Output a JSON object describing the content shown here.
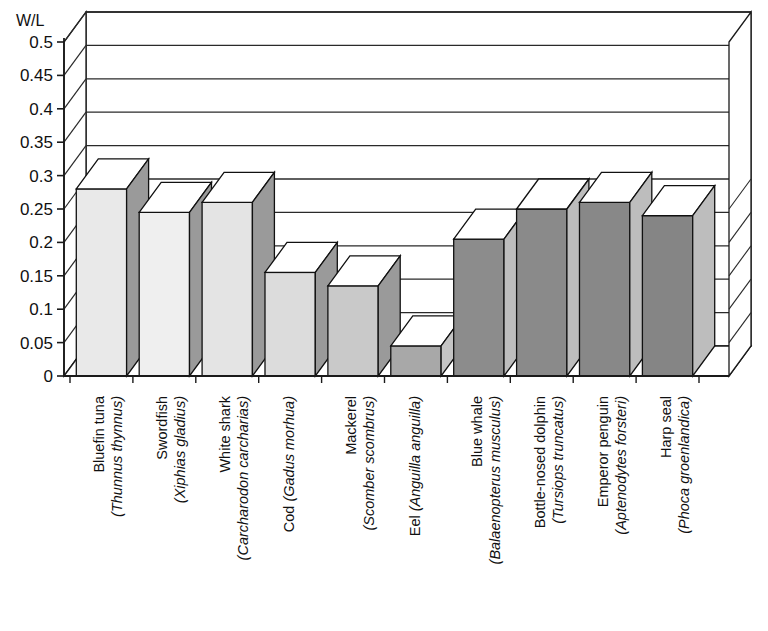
{
  "chart_data": {
    "type": "bar",
    "title": "",
    "xlabel": "",
    "ylabel": "W/L",
    "ylim": [
      0,
      0.5
    ],
    "grid": true,
    "legend": "none",
    "style": "3d-column",
    "ytick_labels": [
      "0",
      "0.05",
      "0.1",
      "0.15",
      "0.2",
      "0.25",
      "0.3",
      "0.35",
      "0.4",
      "0.45",
      "0.5"
    ],
    "ytick_values": [
      0,
      0.05,
      0.1,
      0.15,
      0.2,
      0.25,
      0.3,
      0.35,
      0.4,
      0.45,
      0.5
    ],
    "categories": [
      "Bluefin tuna (Thunnus thynnus)",
      "Swordfish (Xiphias gladius)",
      "White shark (Carcharodon carcharias)",
      "Cod (Gadus morhua)",
      "Mackerel (Scomber scombrus)",
      "Eel (Anguilla anguilla)",
      "Blue whale (Balaenopterus musculus)",
      "Bottle-nosed dolphin (Tursiops truncatus)",
      "Emperor penguin (Aptenodytes forsteri)",
      "Harp seal (Phoca groenlandica)"
    ],
    "values": [
      0.28,
      0.245,
      0.26,
      0.155,
      0.135,
      0.045,
      0.205,
      0.25,
      0.26,
      0.24
    ],
    "bars": [
      {
        "common": "Bluefin tuna",
        "sci": "(Thunnus thynnus)",
        "value": 0.28,
        "group": "fish",
        "fill": "#e9e9e9",
        "side": "#9a9a9a"
      },
      {
        "common": "Swordfish",
        "sci": "(Xiphias gladius)",
        "value": 0.245,
        "group": "fish",
        "fill": "#efefef",
        "side": "#9a9a9a"
      },
      {
        "common": "White shark",
        "sci": "(Carcharodon carcharias)",
        "value": 0.26,
        "group": "fish",
        "fill": "#e4e4e4",
        "side": "#9a9a9a"
      },
      {
        "common": "Cod",
        "sci": "(Gadus morhua)",
        "value": 0.155,
        "group": "fish",
        "fill": "#dcdcdc",
        "side": "#9a9a9a"
      },
      {
        "common": "Mackerel",
        "sci": "(Scomber scombrus)",
        "value": 0.135,
        "group": "fish",
        "fill": "#c9c9c9",
        "side": "#9a9a9a"
      },
      {
        "common": "Eel",
        "sci": "(Anguilla anguilla)",
        "value": 0.045,
        "group": "fish",
        "fill": "#a8a8a8",
        "side": "#c4c4c4"
      },
      {
        "common": "Blue whale",
        "sci": "(Balaenopterus musculus)",
        "value": 0.205,
        "group": "mammal",
        "fill": "#8c8c8c",
        "side": "#bdbdbd"
      },
      {
        "common": "Bottle-nosed dolphin",
        "sci": "(Tursiops truncatus)",
        "value": 0.25,
        "group": "mammal",
        "fill": "#8a8a8a",
        "side": "#bdbdbd"
      },
      {
        "common": "Emperor penguin",
        "sci": "(Aptenodytes forsteri)",
        "value": 0.26,
        "group": "bird",
        "fill": "#888888",
        "side": "#bdbdbd"
      },
      {
        "common": "Harp seal",
        "sci": "(Phoca groenlandica)",
        "value": 0.24,
        "group": "mammal",
        "fill": "#858585",
        "side": "#bdbdbd"
      }
    ],
    "colors": {
      "axis_line": "#1a1a1a",
      "grid_line": "#2a2a2a",
      "background": "#ffffff",
      "floor": "#ffffff",
      "bar_top": "#ffffff"
    }
  }
}
